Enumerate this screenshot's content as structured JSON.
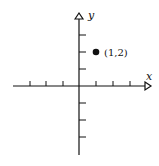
{
  "diagram": {
    "type": "coordinate-plane",
    "x_axis_label": "x",
    "y_axis_label": "y",
    "tick_spacing_units": 1,
    "x_ticks": [
      -3,
      -2,
      -1,
      1,
      2,
      3
    ],
    "y_ticks": [
      -3,
      -2,
      -1,
      1,
      2,
      3
    ],
    "points": [
      {
        "x": 1,
        "y": 2,
        "label": "(1,2)"
      }
    ],
    "colors": {
      "ink": "#111111",
      "background": "#ffffff"
    }
  }
}
